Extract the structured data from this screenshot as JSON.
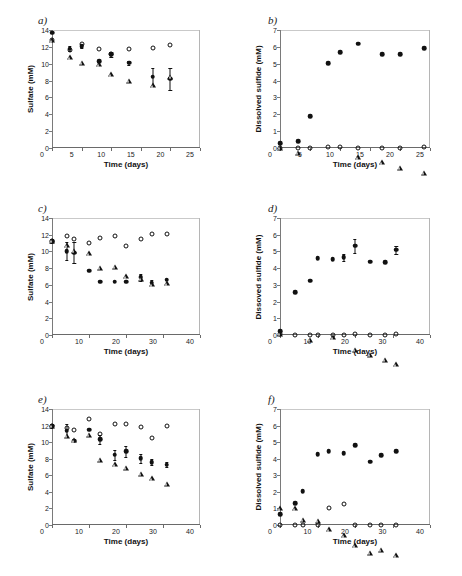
{
  "figure": {
    "panels": [
      {
        "id": "a",
        "label": "a)"
      },
      {
        "id": "b",
        "label": "b)"
      },
      {
        "id": "c",
        "label": "c)"
      },
      {
        "id": "d",
        "label": "d)"
      },
      {
        "id": "e",
        "label": "e)"
      },
      {
        "id": "f",
        "label": "f)"
      }
    ]
  },
  "chart_data": [
    {
      "panel": "a",
      "type": "scatter",
      "title": "a)",
      "xlabel": "Time (days)",
      "ylabel": "Sulfate (mM)",
      "xlim": [
        0,
        25
      ],
      "ylim": [
        0,
        14
      ],
      "xticks": [
        0,
        5,
        10,
        15,
        20,
        25
      ],
      "yticks": [
        0,
        2,
        4,
        6,
        8,
        10,
        12,
        14
      ],
      "grid": false,
      "legend": "none",
      "series": [
        {
          "name": "filled-diamond",
          "marker": "filled",
          "x": [
            0,
            3,
            5,
            8,
            10,
            13,
            17,
            20
          ],
          "y": [
            13.7,
            11.8,
            12.1,
            10.3,
            11.1,
            10.1,
            8.45,
            8.2
          ],
          "yerr": [
            0.0,
            0.25,
            0.2,
            0.0,
            0.3,
            0.2,
            1.0,
            1.35
          ]
        },
        {
          "name": "open-circle",
          "marker": "open-circle",
          "x": [
            0,
            3,
            5,
            8,
            10,
            13,
            17,
            20
          ],
          "y": [
            12.8,
            11.6,
            12.3,
            11.8,
            11.1,
            11.7,
            11.9,
            12.2
          ],
          "yerr": [
            0,
            0,
            0,
            0,
            0,
            0,
            0,
            0
          ]
        },
        {
          "name": "open-triangle",
          "marker": "open-triangle",
          "x": [
            0,
            3,
            5,
            8,
            10,
            13,
            17,
            20
          ],
          "y": [
            12.8,
            11.35,
            11.3,
            11.7,
            11.1,
            10.95,
            11.0,
            12.6
          ],
          "yerr": [
            0,
            0,
            0,
            0,
            0,
            0,
            0,
            0
          ]
        }
      ]
    },
    {
      "panel": "b",
      "type": "scatter",
      "title": "b)",
      "xlabel": "Time (days)",
      "ylabel": "Dissolved sulfide (mM)",
      "xlim": [
        0,
        25
      ],
      "ylim": [
        0,
        7
      ],
      "xticks": [
        0,
        5,
        10,
        15,
        20,
        25
      ],
      "yticks": [
        0,
        1,
        2,
        3,
        4,
        5,
        6,
        7
      ],
      "grid": false,
      "legend": "none",
      "series": [
        {
          "name": "filled-diamond",
          "marker": "filled",
          "x": [
            0,
            3,
            5,
            8,
            10,
            13,
            17,
            20,
            24
          ],
          "y": [
            0.28,
            0.42,
            1.9,
            5.02,
            5.7,
            6.18,
            5.57,
            5.57,
            5.92
          ],
          "yerr": [
            0,
            0,
            0,
            0,
            0,
            0,
            0,
            0,
            0
          ]
        },
        {
          "name": "open-circle",
          "marker": "open-circle",
          "x": [
            0,
            3,
            5,
            8,
            10,
            13,
            17,
            20,
            24
          ],
          "y": [
            0.02,
            0.02,
            0.02,
            0.04,
            0.04,
            0.02,
            0.02,
            0.02,
            0.04
          ],
          "yerr": [
            0,
            0,
            0,
            0,
            0,
            0,
            0,
            0,
            0
          ]
        },
        {
          "name": "open-triangle",
          "marker": "open-triangle",
          "x": [
            0,
            3,
            13,
            17,
            20,
            24
          ],
          "y": [
            0.02,
            0.02,
            0.04,
            0.04,
            0.02,
            0.02
          ],
          "yerr": [
            0,
            0,
            0,
            0,
            0,
            0
          ]
        }
      ]
    },
    {
      "panel": "c",
      "type": "scatter",
      "title": "c)",
      "xlabel": "Time (days)",
      "ylabel": "Sulfate (mM)",
      "xlim": [
        0,
        40
      ],
      "ylim": [
        0,
        14
      ],
      "xticks": [
        0,
        10,
        20,
        30,
        40
      ],
      "yticks": [
        0,
        2,
        4,
        6,
        8,
        10,
        12,
        14
      ],
      "grid": false,
      "legend": "none",
      "series": [
        {
          "name": "filled-diamond",
          "marker": "filled",
          "x": [
            0,
            4,
            6,
            10,
            13,
            17,
            20,
            24,
            27,
            31
          ],
          "y": [
            11.25,
            10.05,
            9.85,
            7.7,
            6.4,
            6.4,
            6.4,
            6.9,
            6.25,
            6.6
          ],
          "yerr": [
            0.2,
            1.1,
            1.25,
            0,
            0,
            0,
            0,
            0.4,
            0.3,
            0
          ]
        },
        {
          "name": "open-circle",
          "marker": "open-circle",
          "x": [
            0,
            4,
            6,
            10,
            13,
            17,
            20,
            24,
            27,
            31
          ],
          "y": [
            11.25,
            11.85,
            11.5,
            11.05,
            11.55,
            11.9,
            10.65,
            11.5,
            12.1,
            12.05
          ],
          "yerr": [
            0,
            0,
            0,
            0,
            0,
            0,
            0,
            0,
            0,
            0
          ]
        },
        {
          "name": "open-triangle",
          "marker": "open-triangle",
          "x": [
            0,
            4,
            6,
            10,
            13,
            17,
            20,
            24,
            27,
            31
          ],
          "y": [
            11.25,
            11.35,
            11.3,
            11.6,
            10.45,
            11.15,
            10.6,
            10.9,
            10.85,
            11.6
          ],
          "yerr": [
            0,
            0,
            0,
            0,
            0,
            0,
            0,
            0,
            0,
            0
          ]
        }
      ]
    },
    {
      "panel": "d",
      "type": "scatter",
      "title": "d)",
      "xlabel": "Time (days)",
      "ylabel": "Dissoved sulfide (mM)",
      "xlim": [
        0,
        40
      ],
      "ylim": [
        0,
        7
      ],
      "xticks": [
        0,
        10,
        20,
        30,
        40
      ],
      "yticks": [
        0,
        1,
        2,
        3,
        4,
        5,
        6,
        7
      ],
      "grid": false,
      "legend": "none",
      "series": [
        {
          "name": "filled-diamond",
          "marker": "filled",
          "x": [
            0,
            4,
            8,
            10,
            14,
            17,
            20,
            24,
            28,
            31
          ],
          "y": [
            0.22,
            2.55,
            3.25,
            4.6,
            4.55,
            4.65,
            5.35,
            4.38,
            4.35,
            5.1
          ],
          "yerr": [
            0,
            0,
            0,
            0,
            0,
            0.2,
            0.42,
            0,
            0,
            0.25
          ]
        },
        {
          "name": "open-circle",
          "marker": "open-circle",
          "x": [
            0,
            4,
            8,
            10,
            14,
            17,
            20,
            24,
            28,
            31
          ],
          "y": [
            0.05,
            0.02,
            0.02,
            0.02,
            0.02,
            0.02,
            0.04,
            0.02,
            0.02,
            0.08
          ],
          "yerr": [
            0,
            0,
            0,
            0,
            0,
            0,
            0,
            0,
            0,
            0
          ]
        },
        {
          "name": "open-triangle",
          "marker": "open-triangle",
          "x": [
            0,
            8,
            14,
            20,
            24,
            28,
            31
          ],
          "y": [
            0.06,
            0.02,
            0.45,
            0.02,
            0.02,
            0.02,
            0.04
          ],
          "yerr": [
            0,
            0,
            0,
            0,
            0,
            0,
            0
          ]
        }
      ]
    },
    {
      "panel": "e",
      "type": "scatter",
      "title": "e)",
      "xlabel": "Time (days)",
      "ylabel": "Sulfate (mM)",
      "xlim": [
        0,
        40
      ],
      "ylim": [
        0,
        14
      ],
      "xticks": [
        0,
        10,
        20,
        30,
        40
      ],
      "yticks": [
        0,
        2,
        4,
        6,
        8,
        10,
        12,
        14
      ],
      "grid": false,
      "legend": "none",
      "series": [
        {
          "name": "filled-diamond",
          "marker": "filled",
          "x": [
            0,
            4,
            6,
            10,
            13,
            17,
            20,
            24,
            27,
            31
          ],
          "y": [
            12.0,
            11.4,
            10.15,
            11.5,
            10.35,
            8.5,
            8.9,
            8.05,
            7.6,
            7.3
          ],
          "yerr": [
            0.25,
            0.75,
            0,
            0,
            0.55,
            0.6,
            0.65,
            0.55,
            0.4,
            0.35
          ]
        },
        {
          "name": "open-circle",
          "marker": "open-circle",
          "x": [
            0,
            4,
            6,
            10,
            13,
            17,
            20,
            24,
            27,
            31
          ],
          "y": [
            12.0,
            11.75,
            11.5,
            12.75,
            11.0,
            12.2,
            12.2,
            11.85,
            10.5,
            12.0
          ],
          "yerr": [
            0,
            0,
            0,
            0,
            0,
            0,
            0,
            0,
            0,
            0
          ]
        },
        {
          "name": "open-triangle",
          "marker": "open-triangle",
          "x": [
            0,
            4,
            6,
            10,
            13,
            17,
            20,
            24,
            27,
            31
          ],
          "y": [
            12.0,
            11.35,
            11.45,
            12.7,
            10.3,
            10.35,
            10.55,
            10.4,
            10.45,
            10.4
          ],
          "yerr": [
            0,
            0,
            0,
            0,
            0,
            0,
            0,
            0,
            0,
            0
          ]
        }
      ]
    },
    {
      "panel": "f",
      "type": "scatter",
      "title": "f)",
      "xlabel": "Time (days)",
      "ylabel": "Dissolved sulfide (mM)",
      "xlim": [
        0,
        40
      ],
      "ylim": [
        0,
        7
      ],
      "xticks": [
        0,
        10,
        20,
        30,
        40
      ],
      "yticks": [
        0,
        1,
        2,
        3,
        4,
        5,
        6,
        7
      ],
      "grid": false,
      "legend": "none",
      "series": [
        {
          "name": "filled-diamond",
          "marker": "filled",
          "x": [
            0,
            4,
            6,
            10,
            13,
            17,
            20,
            24,
            27,
            31
          ],
          "y": [
            0.65,
            1.3,
            2.05,
            4.27,
            4.45,
            4.35,
            4.8,
            3.82,
            4.2,
            4.45
          ],
          "yerr": [
            0,
            0,
            0,
            0,
            0,
            0,
            0,
            0,
            0,
            0
          ]
        },
        {
          "name": "open-circle",
          "marker": "open-circle",
          "x": [
            0,
            4,
            6,
            10,
            13,
            17,
            20,
            24,
            27,
            31
          ],
          "y": [
            0.03,
            0.03,
            0.03,
            0.03,
            1.0,
            1.25,
            0.03,
            0.03,
            0.03,
            0.03
          ],
          "yerr": [
            0,
            0,
            0,
            0,
            0,
            0,
            0,
            0,
            0,
            0
          ]
        },
        {
          "name": "open-triangle",
          "marker": "open-triangle",
          "x": [
            0,
            4,
            6,
            10,
            13,
            17,
            20,
            24,
            27,
            31
          ],
          "y": [
            1.0,
            1.3,
            0.92,
            1.15,
            0.95,
            0.88,
            0.6,
            0.45,
            0.92,
            0.9
          ],
          "yerr": [
            0,
            0,
            0,
            0,
            0,
            0,
            0,
            0,
            0,
            0
          ]
        }
      ]
    }
  ]
}
